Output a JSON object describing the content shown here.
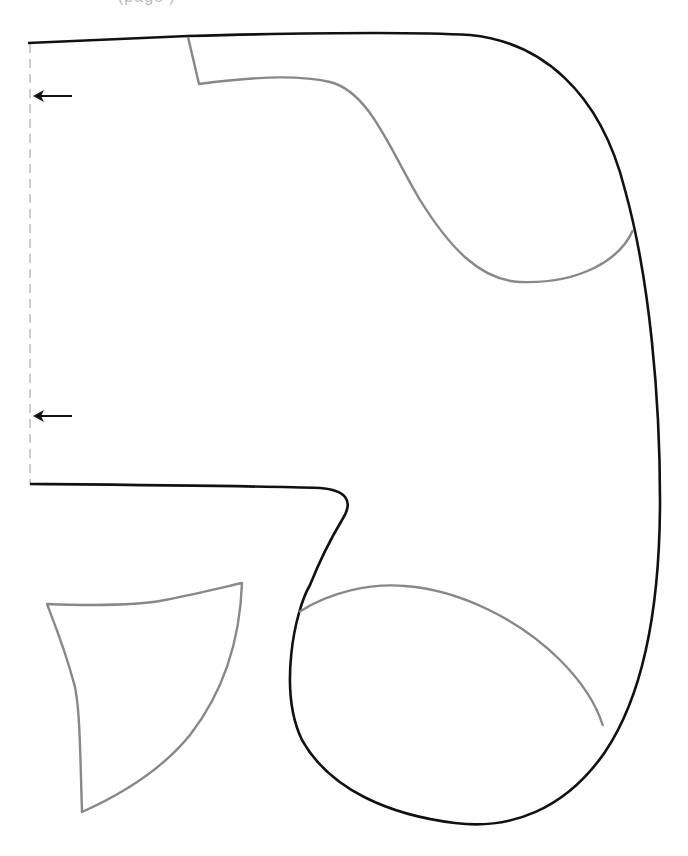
{
  "header": {
    "clipped_text": "(page            )"
  },
  "diagram": {
    "colors": {
      "cut_line": "#111111",
      "stitch_line": "#888888",
      "fold_line": "#cccccc",
      "arrow": "#111111",
      "background": "#ffffff"
    },
    "pieces": [
      {
        "name": "main-body-piece",
        "line": "cut_line"
      },
      {
        "name": "upper-inner-seam",
        "line": "stitch_line"
      },
      {
        "name": "lower-inner-seam",
        "line": "stitch_line"
      },
      {
        "name": "separate-gusset-piece",
        "line": "stitch_line"
      }
    ],
    "fold_marker": {
      "type": "dashed vertical fold line",
      "arrows": 2,
      "direction": "left"
    }
  }
}
